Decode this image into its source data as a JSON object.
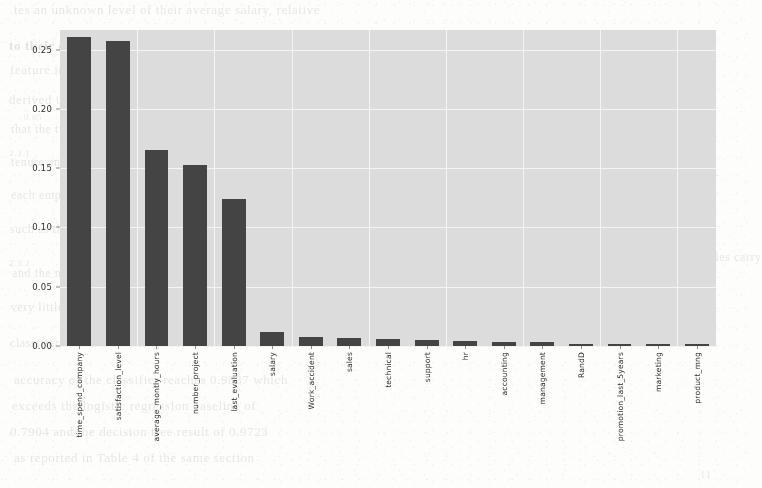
{
  "figure": {
    "background_color": "#fdfdfb",
    "plot_background_color": "#dcdcdc",
    "grid_color": "#f4f4f4",
    "bar_color": "#444444"
  },
  "chart_data": {
    "type": "bar",
    "title": "",
    "xlabel": "",
    "ylabel": "",
    "ylim": [
      0.0,
      0.2665
    ],
    "grid": true,
    "legend": "none",
    "orientation": "vertical",
    "ytick_labels": [
      "0.00",
      "0.05",
      "0.10",
      "0.15",
      "0.20",
      "0.25"
    ],
    "ytick_values": [
      0.0,
      0.05,
      0.1,
      0.15,
      0.2,
      0.25
    ],
    "categories": [
      "time_spend_company",
      "satisfaction_level",
      "average_montly_hours",
      "number_project",
      "last_evaluation",
      "salary",
      "Work_accident",
      "sales",
      "technical",
      "support",
      "hr",
      "accounting",
      "management",
      "RandD",
      "promotion_last_5years",
      "marketing",
      "product_mng"
    ],
    "values": [
      0.261,
      0.257,
      0.165,
      0.153,
      0.124,
      0.012,
      0.008,
      0.007,
      0.006,
      0.005,
      0.004,
      0.003,
      0.003,
      0.002,
      0.002,
      0.002,
      0.002
    ]
  },
  "scan_bleed": {
    "lines": [
      {
        "text": "tes an unknown level of their average salary, relative",
        "x": 14,
        "y": 2,
        "size": 13,
        "head": false
      },
      {
        "text": "to their department's mean compensation and the",
        "x": 9,
        "y": 38,
        "size": 13,
        "head": true
      },
      {
        "text": "feature importances extracted from the",
        "x": 10,
        "y": 62,
        "size": 13,
        "head": false
      },
      {
        "text": "derived using the Random Forest model",
        "x": 9,
        "y": 92,
        "size": 13,
        "head": false
      },
      {
        "text": "0.05",
        "x": 24,
        "y": 112,
        "size": 9,
        "head": false
      },
      {
        "text": "that the two most influential variables are the",
        "x": 11,
        "y": 122,
        "size": 12,
        "head": false
      },
      {
        "text": "2.3.1",
        "x": 9,
        "y": 148,
        "size": 9,
        "head": false
      },
      {
        "text": "tenure and the reported satisfaction score of",
        "x": 11,
        "y": 155,
        "size": 12,
        "head": false
      },
      {
        "text": "4.2 Feature ranking",
        "x": 565,
        "y": 155,
        "size": 12,
        "head": true
      },
      {
        "text": "each employee, followed by workload metrics",
        "x": 11,
        "y": 188,
        "size": 12,
        "head": false
      },
      {
        "text": "such as the average monthly hours worked",
        "x": 10,
        "y": 222,
        "size": 12,
        "head": false
      },
      {
        "text": "2.3.2",
        "x": 9,
        "y": 258,
        "size": 9,
        "head": false
      },
      {
        "text": "and the number of projects assigned",
        "x": 12,
        "y": 266,
        "size": 12,
        "head": false
      },
      {
        "text": "departmental dummy variables carry",
        "x": 565,
        "y": 250,
        "size": 12,
        "head": false
      },
      {
        "text": "very little predictive weight in the final",
        "x": 11,
        "y": 300,
        "size": 12,
        "head": false
      },
      {
        "text": "classifier, each contributing below 0.01",
        "x": 10,
        "y": 336,
        "size": 12,
        "head": false
      },
      {
        "text": "accuracy of the classifier reaches 0.9837 which",
        "x": 14,
        "y": 372,
        "size": 13,
        "head": false
      },
      {
        "text": "exceeds the logistic regression baseline of",
        "x": 12,
        "y": 398,
        "size": 13,
        "head": false
      },
      {
        "text": "0.7904 and the decision tree result of 0.9723",
        "x": 10,
        "y": 424,
        "size": 13,
        "head": false
      },
      {
        "text": "as reported in Table 4 of the same section",
        "x": 14,
        "y": 450,
        "size": 13,
        "head": false
      },
      {
        "text": "11",
        "x": 700,
        "y": 468,
        "size": 11,
        "head": false
      }
    ]
  }
}
